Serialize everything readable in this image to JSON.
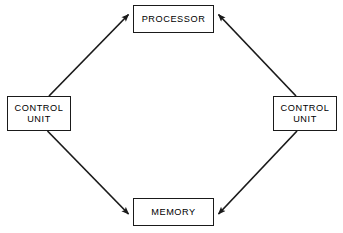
{
  "diagram": {
    "canvas": {
      "width": 343,
      "height": 233,
      "background": "#ffffff"
    },
    "style": {
      "line_color": "#1a1a1a",
      "box_border": "#1a1a1a",
      "box_fill": "#ffffff",
      "text_color": "#000000"
    },
    "nodes": [
      {
        "id": "processor",
        "label": "PROCESSOR",
        "lines": [
          "PROCESSOR"
        ],
        "shape": "rectangle",
        "position": "top-center",
        "box": {
          "x": 133,
          "y": 5,
          "width": 81,
          "height": 28
        }
      },
      {
        "id": "control-unit-left",
        "label": "CONTROL UNIT",
        "lines": [
          "CONTROL",
          "UNIT"
        ],
        "shape": "rectangle",
        "position": "middle-left",
        "box": {
          "x": 7,
          "y": 96,
          "width": 64,
          "height": 35
        }
      },
      {
        "id": "control-unit-right",
        "label": "CONTROL UNIT",
        "lines": [
          "CONTROL",
          "UNIT"
        ],
        "shape": "rectangle",
        "position": "middle-right",
        "box": {
          "x": 273,
          "y": 96,
          "width": 64,
          "height": 35
        }
      },
      {
        "id": "memory",
        "label": "MEMORY",
        "lines": [
          "MEMORY"
        ],
        "shape": "rectangle",
        "position": "bottom-center",
        "box": {
          "x": 133,
          "y": 198,
          "width": 81,
          "height": 28
        }
      }
    ],
    "edges": [
      {
        "id": "edge-cu-left-to-processor",
        "from": "control-unit-left",
        "to": "processor",
        "arrow": "single",
        "arrow_at": "processor",
        "direction": "up-right"
      },
      {
        "id": "edge-cu-right-to-processor",
        "from": "control-unit-right",
        "to": "processor",
        "arrow": "single",
        "arrow_at": "processor",
        "direction": "up-left"
      },
      {
        "id": "edge-cu-left-to-memory",
        "from": "control-unit-left",
        "to": "memory",
        "arrow": "single",
        "arrow_at": "memory",
        "direction": "down-right"
      },
      {
        "id": "edge-cu-right-to-memory",
        "from": "control-unit-right",
        "to": "memory",
        "arrow": "single",
        "arrow_at": "memory",
        "direction": "down-left"
      }
    ]
  }
}
